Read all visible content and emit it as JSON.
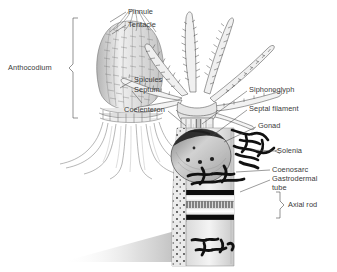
{
  "figure": {
    "background_color": "#ffffff",
    "ink_color": "#1a1a1a",
    "label_color": "#3a3a3a",
    "width": 337,
    "height": 272
  },
  "labels": [
    {
      "id": "pinnule",
      "text": "Pinnule",
      "x": 128,
      "y": 8,
      "align": "left"
    },
    {
      "id": "tentacle",
      "text": "Tentacle",
      "x": 128,
      "y": 21,
      "align": "left"
    },
    {
      "id": "anthocodium",
      "text": "Anthocodium",
      "x": 8,
      "y": 64,
      "align": "left"
    },
    {
      "id": "spicules",
      "text": "Spicules",
      "x": 134,
      "y": 78,
      "align": "left"
    },
    {
      "id": "septum",
      "text": "Septum",
      "x": 134,
      "y": 88,
      "align": "left"
    },
    {
      "id": "coelenteron",
      "text": "Coelenteron",
      "x": 124,
      "y": 108,
      "align": "left"
    },
    {
      "id": "siphonoglyph",
      "text": "Siphonoglyph",
      "x": 249,
      "y": 88,
      "align": "left"
    },
    {
      "id": "septal-filament",
      "text": "Septal filament",
      "x": 249,
      "y": 107,
      "align": "left"
    },
    {
      "id": "gonad",
      "text": "Gonad",
      "x": 258,
      "y": 124,
      "align": "left"
    },
    {
      "id": "solenia",
      "text": "Solenia",
      "x": 277,
      "y": 149,
      "align": "left"
    },
    {
      "id": "coenosarc",
      "text": "Coenosarc",
      "x": 272,
      "y": 168,
      "align": "left"
    },
    {
      "id": "gastrodermal-tube",
      "text": "Gastrodermal\ntube",
      "x": 272,
      "y": 177,
      "align": "left"
    },
    {
      "id": "axial-rod",
      "text": "Axial rod",
      "x": 288,
      "y": 203,
      "align": "left"
    }
  ],
  "brackets": [
    {
      "id": "anthocodium-bracket",
      "orientation": "right-facing",
      "x": 72,
      "y_top": 18,
      "y_bottom": 118
    },
    {
      "id": "axial-rod-bracket",
      "orientation": "right-facing",
      "x": 277,
      "y_top": 193,
      "y_bottom": 217
    }
  ],
  "structures": [
    {
      "id": "retracted-polyp",
      "name": "Retracted polyp (left)",
      "description": "Closed bud-shaped anthocodium with longitudinal rows of spicules, flaring stalk and root-like base"
    },
    {
      "id": "expanded-polyp",
      "name": "Expanded polyp (right)",
      "description": "Eight pinnate tentacles bearing pinnules, open anthocodium with septa and siphonoglyph"
    },
    {
      "id": "gonad-body",
      "name": "Gonad",
      "description": "Rounded bulbous body with dark spots within the coelenteron"
    },
    {
      "id": "solenia-network",
      "name": "Solenia",
      "description": "Black irregular branching gastrodermal canals in the coenenchyme"
    },
    {
      "id": "axial-rod-core",
      "name": "Axial rod",
      "description": "Horizontally banded core: black bands above and below a hatched central stripe"
    },
    {
      "id": "base-shadow",
      "name": "Cast shadow",
      "description": "Soft gray gradient at the lower left of the colony stalk"
    }
  ]
}
